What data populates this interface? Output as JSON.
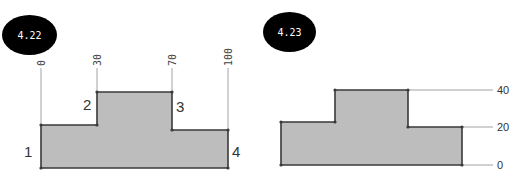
{
  "figures": [
    {
      "badge": "4.22",
      "x_ticks": [
        {
          "label": "0",
          "x": 41
        },
        {
          "label": "30",
          "x": 97
        },
        {
          "label": "70",
          "x": 172
        },
        {
          "label": "100",
          "x": 228
        }
      ],
      "step_labels": [
        {
          "label": "1",
          "x": 24,
          "y": 157
        },
        {
          "label": "2",
          "x": 83,
          "y": 110
        },
        {
          "label": "3",
          "x": 176,
          "y": 112
        },
        {
          "label": "4",
          "x": 232,
          "y": 157
        }
      ]
    },
    {
      "badge": "4.23",
      "y_ticks": [
        {
          "label": "40",
          "y": 90
        },
        {
          "label": "20",
          "y": 127
        },
        {
          "label": "0",
          "y": 165
        }
      ]
    }
  ],
  "colors": {
    "fill": "#bdbdbd",
    "stroke": "#3a3a3a",
    "badge": "#000000"
  }
}
